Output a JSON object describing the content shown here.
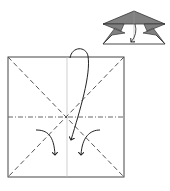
{
  "diagram": {
    "type": "origami-fold-instruction",
    "colors": {
      "background": "#ffffff",
      "line": "#333333",
      "fold_line": "#555555",
      "crease": "#bbbbbb",
      "flap_fill": "#808080"
    },
    "preview": {
      "description": "folded result preview (top-right)"
    },
    "main_square": {
      "description": "square paper with valley diagonals, horizontal mountain fold, vertical crease",
      "arrows": [
        "long-fold-arrow",
        "left-curved-arrow",
        "right-curved-arrow"
      ]
    }
  }
}
